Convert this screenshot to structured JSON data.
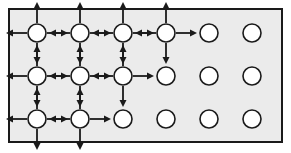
{
  "figure": {
    "canvas": {
      "width": 291,
      "height": 153
    },
    "frame": {
      "name": "diagram-frame",
      "x": 8,
      "y": 8,
      "width": 275,
      "height": 135,
      "fill_color": "#ebebeb",
      "stroke_color": "#1a1a1a",
      "stroke_width": 2
    },
    "grid": {
      "columns": 6,
      "rows": 3,
      "column_x": [
        37,
        80,
        123,
        166,
        209,
        252
      ],
      "row_y": [
        33,
        76,
        119
      ],
      "node_radius": 9,
      "node_fill": "#ffffff",
      "node_stroke": "#1a1a1a",
      "node_stroke_width": 1.6
    },
    "arrows": {
      "color": "#1a1a1a",
      "shaft_width": 1.8,
      "head_length": 7,
      "head_width": 7,
      "length": 21,
      "directions": [
        "up",
        "down",
        "left",
        "right"
      ],
      "description": "Each active node emits four arrows pointing outward; adjacent active nodes show back-to-back arrowheads."
    },
    "active_nodes": [
      {
        "row": 0,
        "col": 0
      },
      {
        "row": 0,
        "col": 1
      },
      {
        "row": 0,
        "col": 2
      },
      {
        "row": 0,
        "col": 3
      },
      {
        "row": 1,
        "col": 0
      },
      {
        "row": 1,
        "col": 1
      },
      {
        "row": 1,
        "col": 2
      },
      {
        "row": 2,
        "col": 0
      },
      {
        "row": 2,
        "col": 1
      }
    ],
    "plain_nodes": [
      {
        "row": 0,
        "col": 4
      },
      {
        "row": 0,
        "col": 5
      },
      {
        "row": 1,
        "col": 3
      },
      {
        "row": 1,
        "col": 4
      },
      {
        "row": 1,
        "col": 5
      },
      {
        "row": 2,
        "col": 2
      },
      {
        "row": 2,
        "col": 3
      },
      {
        "row": 2,
        "col": 4
      },
      {
        "row": 2,
        "col": 5
      }
    ],
    "counts": {
      "total_nodes": 18,
      "active_nodes": 9,
      "plain_nodes": 9,
      "active_per_row": [
        4,
        3,
        2
      ]
    }
  }
}
